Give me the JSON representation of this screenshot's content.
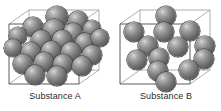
{
  "figure": {
    "background_color": "#ffffff",
    "width": 221,
    "height": 111
  },
  "style": {
    "sphere_fill_light": "#d8d8d8",
    "sphere_fill_mid": "#8f8f8f",
    "sphere_fill_dark": "#4c4c4c",
    "sphere_outline": "#3a3a3a",
    "cube_edge_color": "#4a4a4a",
    "cube_edge_back_color": "#9a9a9a",
    "label_color": "#2b2b2b"
  },
  "panels": [
    {
      "id": "substance-a",
      "label": "Substance A",
      "atom_count": 22,
      "packing": "dense",
      "cube": {
        "front_face": [
          [
            9,
            24
          ],
          [
            79,
            24
          ],
          [
            79,
            84
          ],
          [
            9,
            84
          ]
        ],
        "back_face": [
          [
            29,
            10
          ],
          [
            99,
            10
          ],
          [
            99,
            70
          ],
          [
            29,
            70
          ]
        ]
      },
      "atoms": [
        {
          "cx": 57,
          "cy": 17,
          "r": 11
        },
        {
          "cx": 78,
          "cy": 21,
          "r": 10
        },
        {
          "cx": 33,
          "cy": 27,
          "r": 10
        },
        {
          "cx": 54,
          "cy": 30,
          "r": 11
        },
        {
          "cx": 73,
          "cy": 33,
          "r": 10
        },
        {
          "cx": 92,
          "cy": 29,
          "r": 9
        },
        {
          "cx": 18,
          "cy": 36,
          "r": 9
        },
        {
          "cx": 41,
          "cy": 40,
          "r": 10
        },
        {
          "cx": 62,
          "cy": 40,
          "r": 10
        },
        {
          "cx": 85,
          "cy": 43,
          "r": 10
        },
        {
          "cx": 100,
          "cy": 38,
          "r": 9
        },
        {
          "cx": 13,
          "cy": 48,
          "r": 9
        },
        {
          "cx": 31,
          "cy": 52,
          "r": 10
        },
        {
          "cx": 51,
          "cy": 51,
          "r": 10
        },
        {
          "cx": 71,
          "cy": 52,
          "r": 10
        },
        {
          "cx": 92,
          "cy": 55,
          "r": 10
        },
        {
          "cx": 23,
          "cy": 64,
          "r": 10
        },
        {
          "cx": 44,
          "cy": 62,
          "r": 10
        },
        {
          "cx": 63,
          "cy": 64,
          "r": 10
        },
        {
          "cx": 82,
          "cy": 66,
          "r": 10
        },
        {
          "cx": 35,
          "cy": 75,
          "r": 10
        },
        {
          "cx": 57,
          "cy": 76,
          "r": 10
        }
      ]
    },
    {
      "id": "substance-b",
      "label": "Substance B",
      "atom_count": 13,
      "packing": "sparse",
      "cube": {
        "front_face": [
          [
            9,
            24
          ],
          [
            79,
            24
          ],
          [
            79,
            84
          ],
          [
            9,
            84
          ]
        ],
        "back_face": [
          [
            29,
            10
          ],
          [
            99,
            10
          ],
          [
            99,
            70
          ],
          [
            29,
            70
          ]
        ]
      },
      "atoms": [
        {
          "cx": 55,
          "cy": 16,
          "r": 10
        },
        {
          "cx": 23,
          "cy": 32,
          "r": 10
        },
        {
          "cx": 53,
          "cy": 32,
          "r": 10
        },
        {
          "cx": 79,
          "cy": 31,
          "r": 10
        },
        {
          "cx": 37,
          "cy": 46,
          "r": 10
        },
        {
          "cx": 67,
          "cy": 47,
          "r": 10
        },
        {
          "cx": 94,
          "cy": 46,
          "r": 10
        },
        {
          "cx": 26,
          "cy": 60,
          "r": 10
        },
        {
          "cx": 48,
          "cy": 58,
          "r": 10
        },
        {
          "cx": 93,
          "cy": 59,
          "r": 10
        },
        {
          "cx": 47,
          "cy": 71,
          "r": 10
        },
        {
          "cx": 78,
          "cy": 70,
          "r": 10
        },
        {
          "cx": 55,
          "cy": 82,
          "r": 10
        }
      ]
    }
  ]
}
